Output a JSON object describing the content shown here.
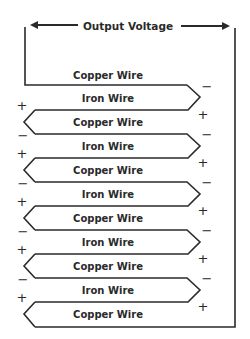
{
  "diagram": {
    "title": "Output Voltage",
    "stroke_color": "#2a2a2a",
    "wires": [
      {
        "label": "Copper Wire"
      },
      {
        "label": "Iron Wire"
      },
      {
        "label": "Copper Wire"
      },
      {
        "label": "Iron Wire"
      },
      {
        "label": "Copper Wire"
      },
      {
        "label": "Iron Wire"
      },
      {
        "label": "Copper Wire"
      },
      {
        "label": "Iron Wire"
      },
      {
        "label": "Copper Wire"
      },
      {
        "label": "Iron Wire"
      },
      {
        "label": "Copper Wire"
      }
    ],
    "right_signs": [
      {
        "top": "−",
        "bottom": "+"
      },
      {
        "top": "−",
        "bottom": "+"
      },
      {
        "top": "−",
        "bottom": "+"
      },
      {
        "top": "−",
        "bottom": "+"
      },
      {
        "top": "−",
        "bottom": "+"
      }
    ],
    "left_signs": [
      {
        "top": "+",
        "bottom": "−"
      },
      {
        "top": "+",
        "bottom": "−"
      },
      {
        "top": "+",
        "bottom": "−"
      },
      {
        "top": "+",
        "bottom": "−"
      },
      {
        "top": "+",
        "bottom": ""
      }
    ]
  }
}
